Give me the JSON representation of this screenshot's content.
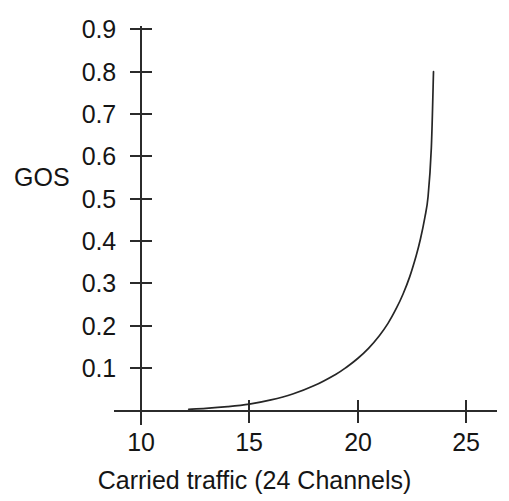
{
  "chart_data": {
    "type": "line",
    "title": "",
    "xlabel": "Carried traffic (24 Channels)",
    "ylabel": "GOS",
    "xlim": [
      8.6,
      26.5
    ],
    "ylim": [
      0.0,
      0.95
    ],
    "grid": false,
    "legend": null,
    "xticks": [
      "10",
      "15",
      "20",
      "25"
    ],
    "xtick_values": [
      10,
      15,
      20,
      25
    ],
    "yticks": [
      "0.1",
      "0.2",
      "0.3",
      "0.4",
      "0.5",
      "0.6",
      "0.7",
      "0.8",
      "0.9"
    ],
    "ytick_values": [
      0.1,
      0.2,
      0.3,
      0.4,
      0.5,
      0.6,
      0.7,
      0.8,
      0.9
    ],
    "series": [
      {
        "name": "GOS",
        "color": "#262626",
        "x": [
          12.2,
          13.0,
          14.0,
          15.0,
          16.0,
          17.0,
          18.0,
          19.0,
          19.5,
          20.0,
          20.5,
          21.0,
          21.4,
          21.8,
          22.1,
          22.4,
          22.7,
          22.9,
          23.1,
          23.25,
          23.4,
          23.5
        ],
        "y": [
          0.002,
          0.004,
          0.008,
          0.014,
          0.024,
          0.038,
          0.058,
          0.085,
          0.102,
          0.122,
          0.146,
          0.176,
          0.205,
          0.242,
          0.275,
          0.315,
          0.365,
          0.405,
          0.455,
          0.505,
          0.62,
          0.8
        ]
      }
    ],
    "annotations": []
  },
  "axis": {
    "y_title": "GOS",
    "x_title": "Carried traffic (24 Channels)"
  }
}
